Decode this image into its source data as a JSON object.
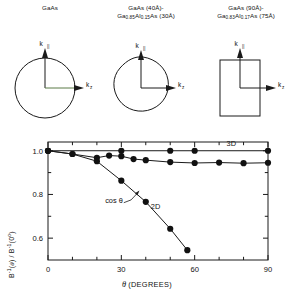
{
  "figure": {
    "panels": [
      {
        "name": "bulk-gaas",
        "line1": "GaAs",
        "line2": "",
        "shape": "circle",
        "axis_vertical": "k",
        "axis_vertical_sub": "||",
        "axis_horizontal": "k",
        "axis_horizontal_sub": "z"
      },
      {
        "name": "superlattice-40-30",
        "line1": "GaAs (40Å)-",
        "line2_pre": "Ga",
        "line2_sub1": "0.85",
        "line2_mid": "Al",
        "line2_sub2": "0.15",
        "line2_post": "As (30Å)",
        "shape": "warped-sphere",
        "axis_vertical": "k",
        "axis_vertical_sub": "||",
        "axis_horizontal": "k",
        "axis_horizontal_sub": "z"
      },
      {
        "name": "superlattice-90-75",
        "line1": "GaAs (90Å)-",
        "line2_pre": "Ga",
        "line2_sub1": "0.83",
        "line2_mid": "Al",
        "line2_sub2": "0.17",
        "line2_post": "As (75Å)",
        "shape": "rectangle",
        "axis_vertical": "k",
        "axis_vertical_sub": "||",
        "axis_horizontal": "k",
        "axis_horizontal_sub": "z"
      }
    ]
  },
  "chart_data": {
    "type": "scatter",
    "title": "",
    "xlabel": "θ (DEGREES)",
    "ylabel": "B⁻¹(θ) / B⁻¹(0°)",
    "xlim": [
      0,
      90
    ],
    "ylim": [
      0.5,
      1.04
    ],
    "xticks": [
      0,
      10,
      20,
      30,
      40,
      50,
      60,
      70,
      80,
      90
    ],
    "xticklabels": [
      "0",
      "",
      "",
      "30",
      "",
      "",
      "60",
      "",
      "",
      "90"
    ],
    "yticks": [
      0.6,
      0.7,
      0.8,
      0.9,
      1.0
    ],
    "yticklabels": [
      "0.6",
      "",
      "0.8",
      "",
      "1.0"
    ],
    "grid": false,
    "legend_position": "inline-annotations",
    "annotations": [
      {
        "text": "3D",
        "x": 75,
        "y": 1.022
      },
      {
        "text": "2D",
        "x": 44,
        "y": 0.735
      },
      {
        "text": "cos θ",
        "x": 27,
        "y": 0.762
      }
    ],
    "series": [
      {
        "name": "3D",
        "label": "3D",
        "x": [
          0,
          30,
          50,
          60,
          90
        ],
        "values": [
          1.0,
          1.0,
          1.0,
          1.0,
          1.0
        ]
      },
      {
        "name": "quasi-3D",
        "label": "",
        "x": [
          0,
          10,
          20,
          25,
          30,
          35,
          40,
          50,
          60,
          70,
          80,
          90
        ],
        "values": [
          1.0,
          0.985,
          0.968,
          0.978,
          0.975,
          0.962,
          0.957,
          0.948,
          0.944,
          0.946,
          0.943,
          0.945
        ]
      },
      {
        "name": "2D",
        "label": "2D",
        "x": [
          0,
          10,
          20,
          30,
          40,
          50,
          57
        ],
        "values": [
          1.0,
          0.985,
          0.952,
          0.863,
          0.766,
          0.643,
          0.545
        ]
      }
    ]
  }
}
